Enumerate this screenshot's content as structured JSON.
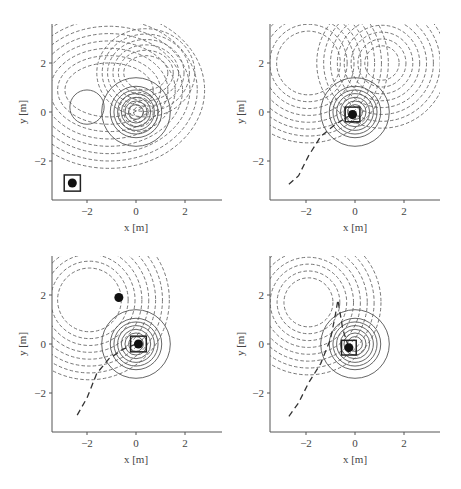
{
  "chart_data": [
    {
      "type": "contour",
      "panel": "top-left",
      "xlabel": "x [m]",
      "ylabel": "y [m]",
      "xticks": [
        -2,
        0,
        2
      ],
      "yticks": [
        -2,
        0,
        2
      ],
      "xlim": [
        -3.5,
        3.5
      ],
      "ylim": [
        -3.6,
        3.5
      ],
      "solid_circle_obstacle": {
        "center": [
          -2.0,
          0.2
        ],
        "radius": 0.7
      },
      "solid_circles_center": [
        0.0,
        0.0
      ],
      "solid_circle_radii": [
        0.3,
        0.45,
        0.6,
        0.75,
        0.9,
        1.05,
        1.4
      ],
      "dashed_contour_peak_hole": {
        "center": [
          0.1,
          2.0
        ],
        "radius": 0.65
      },
      "robot_marker": [
        -2.6,
        -2.9
      ],
      "robot_box_half": 0.33,
      "trajectory": []
    },
    {
      "type": "contour",
      "panel": "top-right",
      "xlabel": "x [m]",
      "ylabel": "y [m]",
      "xticks": [
        -2,
        0,
        2
      ],
      "yticks": [
        -2,
        0,
        2
      ],
      "xlim": [
        -3.5,
        3.5
      ],
      "ylim": [
        -3.6,
        3.5
      ],
      "solid_circles_center": [
        0.0,
        0.0
      ],
      "solid_circle_radii": [
        0.3,
        0.45,
        0.6,
        0.75,
        0.9,
        1.05,
        1.4
      ],
      "dashed_holes": [
        {
          "center": [
            -1.9,
            2.0
          ],
          "radius": 1.3
        },
        {
          "center": [
            1.1,
            2.0
          ],
          "radius": 0.7
        }
      ],
      "robot_marker": [
        -0.1,
        -0.1
      ],
      "robot_box_half": 0.3,
      "trajectory": [
        [
          -2.7,
          -2.95
        ],
        [
          -2.3,
          -2.6
        ],
        [
          -1.9,
          -1.8
        ],
        [
          -1.4,
          -1.0
        ],
        [
          -0.8,
          -0.5
        ],
        [
          -0.3,
          -0.2
        ],
        [
          -0.1,
          -0.1
        ]
      ]
    },
    {
      "type": "contour",
      "panel": "bottom-left",
      "xlabel": "x [m]",
      "ylabel": "y [m]",
      "xticks": [
        -2,
        0,
        2
      ],
      "yticks": [
        -2,
        0,
        2
      ],
      "xlim": [
        -3.5,
        3.5
      ],
      "ylim": [
        -3.6,
        3.5
      ],
      "solid_circles_center": [
        0.0,
        0.0
      ],
      "solid_circle_radii": [
        0.3,
        0.45,
        0.6,
        0.75,
        0.9,
        1.05,
        1.4
      ],
      "dashed_holes": [
        {
          "center": [
            -1.9,
            1.8
          ],
          "radius": 1.3
        }
      ],
      "target_marker": [
        -0.7,
        1.9
      ],
      "robot_marker": [
        0.1,
        0.0
      ],
      "robot_box_half": 0.32,
      "trajectory": [
        [
          -2.4,
          -2.9
        ],
        [
          -2.0,
          -2.2
        ],
        [
          -1.6,
          -1.2
        ],
        [
          -1.1,
          -0.6
        ],
        [
          -0.5,
          -0.2
        ],
        [
          0.0,
          0.0
        ]
      ]
    },
    {
      "type": "contour",
      "panel": "bottom-right",
      "xlabel": "x [m]",
      "ylabel": "y [m]",
      "xticks": [
        -2,
        0,
        2
      ],
      "yticks": [
        -2,
        0,
        2
      ],
      "xlim": [
        -3.5,
        3.5
      ],
      "ylim": [
        -3.6,
        3.5
      ],
      "solid_circles_center": [
        0.0,
        0.0
      ],
      "solid_circle_radii": [
        0.3,
        0.45,
        0.6,
        0.75,
        0.9,
        1.05,
        1.4
      ],
      "dashed_holes": [
        {
          "center": [
            -1.9,
            1.7
          ],
          "radius": 1.0
        }
      ],
      "robot_marker": [
        -0.25,
        -0.15
      ],
      "robot_box_half": 0.3,
      "trajectory": [
        [
          -2.7,
          -2.95
        ],
        [
          -2.3,
          -2.4
        ],
        [
          -1.9,
          -1.6
        ],
        [
          -1.4,
          -0.8
        ],
        [
          -1.0,
          0.2
        ],
        [
          -0.8,
          1.2
        ],
        [
          -0.7,
          1.8
        ],
        [
          -0.5,
          0.6
        ],
        [
          -0.3,
          0.0
        ],
        [
          -0.25,
          -0.15
        ]
      ]
    }
  ],
  "labels": {
    "xlabel": "x [m]",
    "ylabel": "y [m]",
    "tick_neg2": "−2",
    "tick_0": "0",
    "tick_2": "2"
  }
}
